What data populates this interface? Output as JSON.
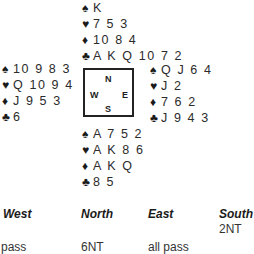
{
  "deal": {
    "north": {
      "spades": "K",
      "hearts": "7 5 3",
      "diamonds": "10 8 4",
      "clubs": "A K Q 10 7 2"
    },
    "west": {
      "spades": "10 9 8 3",
      "hearts": "Q 10 9 4",
      "diamonds": "J 9 5 3",
      "clubs": "6"
    },
    "east": {
      "spades": "Q J 6 4",
      "hearts": "J 2",
      "diamonds": "7 6 2",
      "clubs": "J 9 4 3"
    },
    "south": {
      "spades": "A 7 5 2",
      "hearts": "A K 8 6",
      "diamonds": "A K Q",
      "clubs": "8 5"
    }
  },
  "suit_symbols": {
    "spades": "♠",
    "hearts": "♥",
    "diamonds": "♦",
    "clubs": "♣"
  },
  "compass": {
    "n": "N",
    "w": "W",
    "e": "E",
    "s": "S"
  },
  "auction": {
    "headers": {
      "west": "West",
      "north": "North",
      "east": "East",
      "south": "South"
    },
    "calls": {
      "south_1": "2NT",
      "west_2": "pass",
      "north_2": "6NT",
      "east_2": "all pass"
    }
  }
}
